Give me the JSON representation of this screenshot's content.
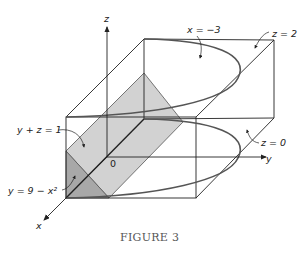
{
  "figure": {
    "caption": "FIGURE 3",
    "axes": {
      "x_label": "x",
      "y_label": "y",
      "z_label": "z",
      "origin_label": "0"
    },
    "annotations": [
      {
        "id": "x-eq-minus-3",
        "text": "x = −3"
      },
      {
        "id": "z-eq-2",
        "text": "z = 2"
      },
      {
        "id": "z-eq-0",
        "text": "z = 0"
      },
      {
        "id": "y-plus-z-eq-1",
        "text": "y + z = 1"
      },
      {
        "id": "y-eq-9-minus-x2",
        "text": "y = 9 − x²"
      }
    ],
    "colors": {
      "line": "#222222",
      "light_plane": "#d2d2d2",
      "dark_plane": "#a8a8a8",
      "curve": "#555555"
    }
  }
}
